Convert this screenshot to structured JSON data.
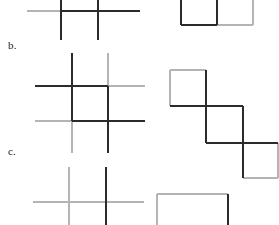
{
  "figure": {
    "width": 279,
    "height": 225,
    "background": "#ffffff",
    "colors": {
      "dark_stroke": "#2b2b2b",
      "light_stroke": "#b4b4b4"
    },
    "stroke_widths": {
      "dark": 2.0,
      "light": 1.6
    },
    "labels": [
      {
        "id": "b",
        "text": "b.",
        "x": 8,
        "y": 40
      },
      {
        "id": "c",
        "text": "c.",
        "x": 8,
        "y": 146
      }
    ],
    "rows": [
      {
        "id": "row-a",
        "label": "a.",
        "label_visible": false,
        "note": "top row, clipped by the top edge of the image",
        "left_diagram": {
          "name": "crossed-lines-grid-a",
          "description": "two vertical lines crossed by one horizontal line",
          "segments": [
            {
              "name": "horizontal-left-light",
              "x1": 27,
              "y1": 11,
              "x2": 61,
              "y2": 11,
              "tone": "light"
            },
            {
              "name": "horizontal-right-dark",
              "x1": 61,
              "y1": 11,
              "x2": 140,
              "y2": 11,
              "tone": "dark"
            },
            {
              "name": "vertical-left-dark",
              "x1": 61,
              "y1": -8,
              "x2": 61,
              "y2": 40,
              "tone": "dark"
            },
            {
              "name": "vertical-right-dark",
              "x1": 98,
              "y1": -8,
              "x2": 98,
              "y2": 40,
              "tone": "dark"
            }
          ]
        },
        "right_diagram": {
          "name": "two-squares-side-by-side",
          "description": "two adjacent squares sharing a vertical edge, clipped at the top",
          "segments": [
            {
              "name": "square-1-left-dark",
              "x1": 181,
              "y1": -8,
              "x2": 181,
              "y2": 25,
              "tone": "dark"
            },
            {
              "name": "square-1-bottom-dark",
              "x1": 181,
              "y1": 25,
              "x2": 217,
              "y2": 25,
              "tone": "dark"
            },
            {
              "name": "shared-vertical-dark",
              "x1": 217,
              "y1": -8,
              "x2": 217,
              "y2": 25,
              "tone": "dark"
            },
            {
              "name": "square-2-bottom-light",
              "x1": 217,
              "y1": 25,
              "x2": 253,
              "y2": 25,
              "tone": "light"
            },
            {
              "name": "square-2-right-light",
              "x1": 253,
              "y1": -8,
              "x2": 253,
              "y2": 25,
              "tone": "light"
            }
          ]
        }
      },
      {
        "id": "row-b",
        "label": "b.",
        "label_visible": true,
        "note": "middle row, fully visible",
        "left_diagram": {
          "name": "crossed-lines-grid-b",
          "description": "tic-tac-toe grid of two verticals and two horizontals, each line part dark and part light",
          "segments": [
            {
              "name": "horizontal-top-left-dark",
              "x1": 35,
              "y1": 86,
              "x2": 108,
              "y2": 86,
              "tone": "dark"
            },
            {
              "name": "horizontal-top-right-light",
              "x1": 108,
              "y1": 86,
              "x2": 145,
              "y2": 86,
              "tone": "light"
            },
            {
              "name": "horizontal-bottom-left-light",
              "x1": 35,
              "y1": 121,
              "x2": 72,
              "y2": 121,
              "tone": "light"
            },
            {
              "name": "horizontal-bottom-right-dark",
              "x1": 72,
              "y1": 121,
              "x2": 145,
              "y2": 121,
              "tone": "dark"
            },
            {
              "name": "vertical-left-top-dark",
              "x1": 72,
              "y1": 53,
              "x2": 72,
              "y2": 121,
              "tone": "dark"
            },
            {
              "name": "vertical-left-bottom-light",
              "x1": 72,
              "y1": 121,
              "x2": 72,
              "y2": 153,
              "tone": "light"
            },
            {
              "name": "vertical-right-top-light",
              "x1": 108,
              "y1": 53,
              "x2": 108,
              "y2": 86,
              "tone": "light"
            },
            {
              "name": "vertical-right-bottom-dark",
              "x1": 108,
              "y1": 86,
              "x2": 108,
              "y2": 153,
              "tone": "dark"
            }
          ]
        },
        "right_diagram": {
          "name": "three-square-staircase",
          "description": "three squares in a descending diagonal staircase chain",
          "segments": [
            {
              "name": "square-1-top-light",
              "x1": 170,
              "y1": 70,
              "x2": 206,
              "y2": 70,
              "tone": "light"
            },
            {
              "name": "square-1-left-light",
              "x1": 170,
              "y1": 70,
              "x2": 170,
              "y2": 106,
              "tone": "light"
            },
            {
              "name": "square-1-right-dark",
              "x1": 206,
              "y1": 70,
              "x2": 206,
              "y2": 106,
              "tone": "dark"
            },
            {
              "name": "square-1-bottom-dark",
              "x1": 170,
              "y1": 106,
              "x2": 206,
              "y2": 106,
              "tone": "dark"
            },
            {
              "name": "square-2-top-dark",
              "x1": 206,
              "y1": 106,
              "x2": 243,
              "y2": 106,
              "tone": "dark"
            },
            {
              "name": "square-2-left-dark",
              "x1": 206,
              "y1": 106,
              "x2": 206,
              "y2": 143,
              "tone": "dark"
            },
            {
              "name": "square-2-right-dark",
              "x1": 243,
              "y1": 106,
              "x2": 243,
              "y2": 143,
              "tone": "dark"
            },
            {
              "name": "square-2-bottom-dark",
              "x1": 206,
              "y1": 143,
              "x2": 243,
              "y2": 143,
              "tone": "dark"
            },
            {
              "name": "square-3-top-dark",
              "x1": 243,
              "y1": 143,
              "x2": 278,
              "y2": 143,
              "tone": "dark"
            },
            {
              "name": "square-3-left-dark",
              "x1": 243,
              "y1": 143,
              "x2": 243,
              "y2": 178,
              "tone": "dark"
            },
            {
              "name": "square-3-right-light",
              "x1": 278,
              "y1": 143,
              "x2": 278,
              "y2": 178,
              "tone": "light"
            },
            {
              "name": "square-3-bottom-light",
              "x1": 243,
              "y1": 178,
              "x2": 278,
              "y2": 178,
              "tone": "light"
            }
          ]
        }
      },
      {
        "id": "row-c",
        "label": "c.",
        "label_visible": true,
        "note": "bottom row, clipped by the bottom edge of the image",
        "left_diagram": {
          "name": "crossed-lines-grid-c",
          "description": "two vertical lines crossed by one light horizontal line, clipped at the bottom",
          "segments": [
            {
              "name": "horizontal-light",
              "x1": 33,
              "y1": 202,
              "x2": 144,
              "y2": 202,
              "tone": "light"
            },
            {
              "name": "vertical-left-light",
              "x1": 69,
              "y1": 167,
              "x2": 69,
              "y2": 233,
              "tone": "light"
            },
            {
              "name": "vertical-right-dark",
              "x1": 106,
              "y1": 167,
              "x2": 106,
              "y2": 233,
              "tone": "dark"
            }
          ]
        },
        "right_diagram": {
          "name": "single-square",
          "description": "one square outline clipped at the bottom of the image",
          "segments": [
            {
              "name": "square-top-light",
              "x1": 157,
              "y1": 194,
              "x2": 228,
              "y2": 194,
              "tone": "light"
            },
            {
              "name": "square-left-light",
              "x1": 157,
              "y1": 194,
              "x2": 157,
              "y2": 233,
              "tone": "light"
            },
            {
              "name": "square-right-dark",
              "x1": 228,
              "y1": 194,
              "x2": 228,
              "y2": 233,
              "tone": "dark"
            }
          ]
        }
      }
    ]
  }
}
